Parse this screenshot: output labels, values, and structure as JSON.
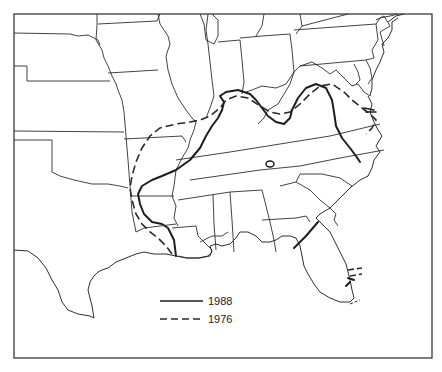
{
  "map": {
    "title": "",
    "region": "Southeastern United States",
    "frame_color": "#3a3a3a",
    "line_color": "#1e1e1e",
    "legend": {
      "items": [
        {
          "label": "1988",
          "style": "solid"
        },
        {
          "label": "1976",
          "style": "dashed"
        }
      ]
    },
    "series": [
      {
        "name": "1988",
        "style": "solid",
        "description": "Solid boundary line from Louisiana north through Arkansas, Kentucky, West Virginia, Virginia to North Carolina coast; additional segments across northern Florida and southeast Florida coast; small closed loop in Georgia"
      },
      {
        "name": "1976",
        "style": "dashed",
        "description": "Dashed boundary line from Louisiana coast north through eastern Texas/Arkansas, across southern Illinois, Kentucky, Virginia to North Carolina coast; short segment near southern Florida"
      }
    ]
  }
}
